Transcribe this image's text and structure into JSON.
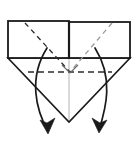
{
  "figure": {
    "canvas": {
      "width": 138,
      "height": 143
    },
    "background_color": "#ffffff",
    "stroke_color": "#1a1a1a",
    "light_stroke_color": "#b9b9b9",
    "dashed_stroke_color": "#2b2b2b"
  },
  "geometry": {
    "paper_outline": {
      "top_left": [
        8,
        21
      ],
      "top_right": [
        130,
        22
      ],
      "mid_left": [
        8,
        58
      ],
      "mid_right": [
        130,
        58
      ],
      "apex": [
        69,
        122
      ]
    },
    "top_band": {
      "left_panel": {
        "x": 8,
        "y": 21,
        "width": 61,
        "height": 37
      },
      "right_panel": {
        "x": 69,
        "y": 22,
        "width": 61,
        "height": 36
      },
      "divider_x": 69
    },
    "fold_lines_dashed": [
      {
        "name": "diagonal-left",
        "from": [
          25,
          23
        ],
        "to": [
          70,
          72
        ]
      },
      {
        "name": "diagonal-right",
        "from": [
          112,
          23
        ],
        "to": [
          70,
          72
        ]
      },
      {
        "name": "horizontal-crease",
        "from": [
          28,
          72
        ],
        "to": [
          112,
          72
        ]
      }
    ],
    "center_line": {
      "from": [
        69,
        58
      ],
      "to": [
        69,
        122
      ]
    },
    "crease_notch": {
      "left": [
        62,
        65
      ],
      "vertex": [
        70,
        73
      ],
      "right": [
        78,
        65
      ]
    },
    "arrows": [
      {
        "name": "left-fold-arrow",
        "start": [
          47,
          48
        ],
        "control_1": [
          28,
          78
        ],
        "control_2": [
          36,
          110
        ],
        "end": [
          48,
          131
        ],
        "head_tip": [
          48,
          133
        ],
        "head_angle_deg": 70
      },
      {
        "name": "right-fold-arrow",
        "start": [
          95,
          48
        ],
        "control_1": [
          114,
          78
        ],
        "control_2": [
          106,
          108
        ],
        "end": [
          99,
          130
        ],
        "head_tip": [
          99,
          132
        ],
        "head_angle_deg": 110
      }
    ]
  },
  "labels": {
    "caption": ""
  }
}
